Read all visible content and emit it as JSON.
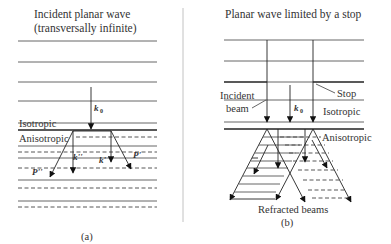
{
  "panel_a": {
    "title_line1": "Incident planar wave",
    "title_line2": "(transversally infinite)",
    "wavevector_label": "k",
    "wavevector_sub": "0",
    "medium_top": "Isotropic",
    "medium_bottom": "Anisotropic",
    "ray_labels": [
      "P''",
      "k''",
      "k'",
      "P'"
    ],
    "caption": "(a)"
  },
  "panel_b": {
    "title": "Planar wave limited by a stop",
    "incident_label_line1": "Incident",
    "incident_label_line2": "beam",
    "wavevector_label": "k",
    "wavevector_sub": "0",
    "stop_label": "Stop",
    "medium_top": "Isotropic",
    "medium_bottom": "Anisotropic",
    "refracted_label": "Refracted beams",
    "caption": "(b)"
  }
}
